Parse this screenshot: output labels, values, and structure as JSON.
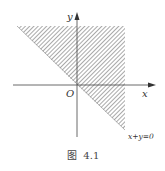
{
  "figure": {
    "caption": "图  4.1",
    "axes": {
      "x_label": "x",
      "y_label": "y",
      "origin_label": "O"
    },
    "region": {
      "description": "half-plane x+y>=0, shaded with diagonal hatching, bounded to plot window",
      "boundary_label": "x+y=0",
      "fill_pattern": "diagonal-hatch",
      "line_color": "#555555"
    },
    "colors": {
      "axis": "#444444",
      "hatch": "#777777",
      "background": "#ffffff"
    }
  }
}
